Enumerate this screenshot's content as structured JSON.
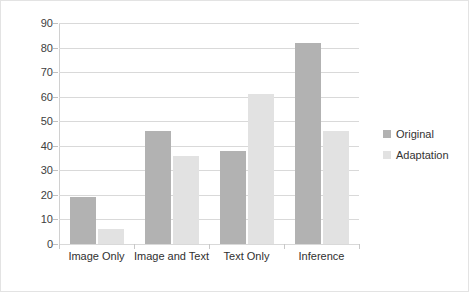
{
  "chart_data": {
    "type": "bar",
    "title": "",
    "xlabel": "",
    "ylabel": "",
    "categories": [
      "Image Only",
      "Image and Text",
      "Text Only",
      "Inference"
    ],
    "series": [
      {
        "name": "Original",
        "values": [
          19,
          46,
          38,
          82
        ],
        "color": "#b2b2b2"
      },
      {
        "name": "Adaptation",
        "values": [
          6,
          36,
          61,
          46
        ],
        "color": "#e2e2e2"
      }
    ],
    "ylim": [
      0,
      90
    ],
    "ytick_step": 10,
    "yticks": [
      0,
      10,
      20,
      30,
      40,
      50,
      60,
      70,
      80,
      90
    ],
    "ytick_labels": [
      "0",
      "10",
      "20",
      "30",
      "40",
      "50",
      "60",
      "70",
      "80",
      "90"
    ],
    "grid": {
      "horizontal": true,
      "vertical": false,
      "color": "#d9d9d9"
    },
    "legend": {
      "position": "right",
      "entries": [
        "Original",
        "Adaptation"
      ]
    },
    "border": {
      "visible": true,
      "color": "#e3e3e3"
    }
  }
}
